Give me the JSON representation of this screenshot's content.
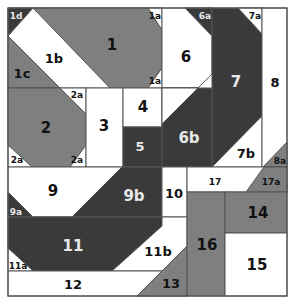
{
  "diagram": {
    "type": "quilt-block-foundation-piecing-pattern",
    "colors": {
      "white": "#ffffff",
      "medium": "#7f7f7f",
      "dark": "#3a3a3a",
      "line": "#555555",
      "label_dark": "#111111",
      "label_light": "#e8e8e8"
    },
    "labels": {
      "p1": "1",
      "p1a": "1a",
      "p1b": "1b",
      "p1c": "1c",
      "p1d": "1d",
      "p2": "2",
      "p2a": "2a",
      "p3": "3",
      "p4": "4",
      "p5": "5",
      "p6": "6",
      "p6a": "6a",
      "p6b": "6b",
      "p7": "7",
      "p7a": "7a",
      "p7b": "7b",
      "p8": "8",
      "p8a": "8a",
      "p9": "9",
      "p9a": "9a",
      "p9b": "9b",
      "p10": "10",
      "p11": "11",
      "p11a": "11a",
      "p11b": "11b",
      "p12": "12",
      "p13": "13",
      "p14": "14",
      "p15": "15",
      "p16": "16",
      "p17": "17",
      "p17a": "17a"
    }
  }
}
